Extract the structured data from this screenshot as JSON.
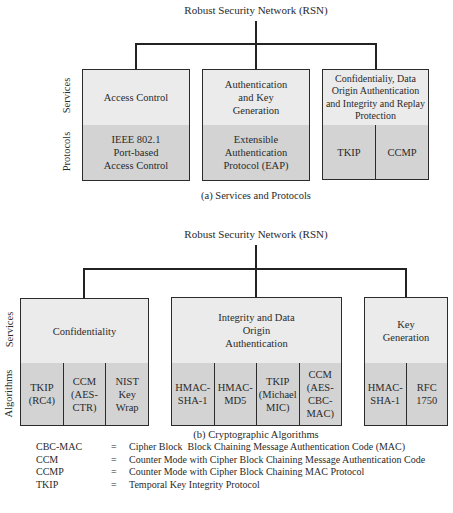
{
  "diagram_a": {
    "root": "Robust Security Network (RSN)",
    "row_labels": {
      "services": "Services",
      "protocols": "Protocols"
    },
    "columns": [
      {
        "service": "Access Control",
        "items": [
          "IEEE 802.1\nPort-based\nAccess Control"
        ]
      },
      {
        "service": "Authentication and Key Generation",
        "items": [
          "Extensible\nAuthentication\nProtocol (EAP)"
        ]
      },
      {
        "service": "Confidentialiy, Data Origin Authentication and Integrity and Replay Protection",
        "items": [
          "TKIP",
          "CCMP"
        ]
      }
    ],
    "caption": "(a) Services and Protocols"
  },
  "diagram_b": {
    "root": "Robust Security Network (RSN)",
    "row_labels": {
      "services": "Services",
      "algorithms": "Algorithms"
    },
    "columns": [
      {
        "service": "Confidentiality",
        "items": [
          "TKIP\n(RC4)",
          "CCM\n(AES-\nCTR)",
          "NIST\nKey\nWrap"
        ]
      },
      {
        "service": "Integrity and Data Origin Authentication",
        "items": [
          "HMAC-\nSHA-1",
          "HMAC-\nMD5",
          "TKIP\n(Michael\nMIC)",
          "CCM\n(AES-\nCBC-\nMAC)"
        ]
      },
      {
        "service": "Key Generation",
        "items": [
          "HMAC-\nSHA-1",
          "RFC\n1750"
        ]
      }
    ],
    "caption": "(b) Cryptographic Algorithms"
  },
  "legend": [
    {
      "abbr": "CBC-MAC",
      "eq": "=",
      "def": "Cipher Block  Block Chaining Message Authentication Code (MAC)"
    },
    {
      "abbr": "CCM",
      "eq": "=",
      "def": "Counter Mode with Cipher Block Chaining Message Authentication Code"
    },
    {
      "abbr": "CCMP",
      "eq": "=",
      "def": "Counter Mode with Cipher Block Chaining MAC Protocol"
    },
    {
      "abbr": "TKIP",
      "eq": "=",
      "def": "Temporal Key Integrity Protocol"
    }
  ]
}
